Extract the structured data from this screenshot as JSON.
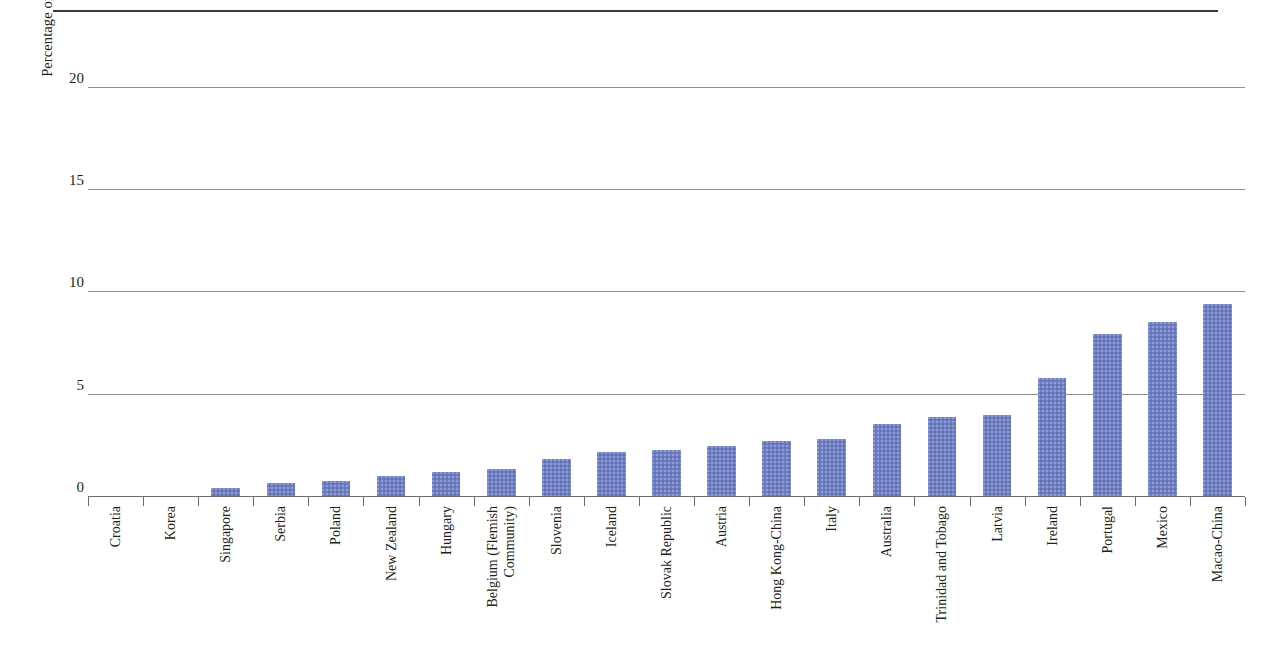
{
  "chart_data": {
    "type": "bar",
    "title": "",
    "xlabel": "",
    "ylabel": "Percentage of students who do not expect to complete an upper secondary degree",
    "ylabel_lines": [
      "Percentage of students who do not expect to complete",
      "an upper secondary degree"
    ],
    "ylim": [
      0,
      21.5
    ],
    "ytick_labels": [
      "0",
      "5",
      "10",
      "15",
      "20"
    ],
    "yticks": [
      0,
      5,
      10,
      15,
      20
    ],
    "grid": true,
    "legend": "none",
    "bar_color": "#6F80C4",
    "gridline_color": "#8D8D8D",
    "axis_color": "#6E6E6E",
    "top_rule_color": "#3A3A3A",
    "categories": [
      "Croatia",
      "Korea",
      "Singapore",
      "Serbia",
      "Poland",
      "New Zealand",
      "Hungary",
      "Belgium (Flemish Community)",
      "Slovenia",
      "Iceland",
      "Slovak Republic",
      "Austria",
      "Hong Kong-China",
      "Italy",
      "Australia",
      "Trinidad and Tobago",
      "Latvia",
      "Ireland",
      "Portugal",
      "Mexico",
      "Macao-China"
    ],
    "category_label_lines": [
      [
        "Croatia"
      ],
      [
        "Korea"
      ],
      [
        "Singapore"
      ],
      [
        "Serbia"
      ],
      [
        "Poland"
      ],
      [
        "New Zealand"
      ],
      [
        "Hungary"
      ],
      [
        "Belgium (Flemish",
        "Community)"
      ],
      [
        "Slovenia"
      ],
      [
        "Iceland"
      ],
      [
        "Slovak Republic"
      ],
      [
        "Austria"
      ],
      [
        "Hong Kong-China"
      ],
      [
        "Italy"
      ],
      [
        "Australia"
      ],
      [
        "Trinidad and Tobago"
      ],
      [
        "Latvia"
      ],
      [
        "Ireland"
      ],
      [
        "Portugal"
      ],
      [
        "Mexico"
      ],
      [
        "Macao-China"
      ]
    ],
    "values": [
      0.0,
      0.0,
      0.4,
      0.65,
      0.75,
      1.0,
      1.15,
      1.3,
      1.8,
      2.15,
      2.25,
      2.45,
      2.7,
      2.8,
      3.5,
      3.85,
      3.95,
      5.75,
      7.9,
      8.5,
      9.4
    ]
  }
}
